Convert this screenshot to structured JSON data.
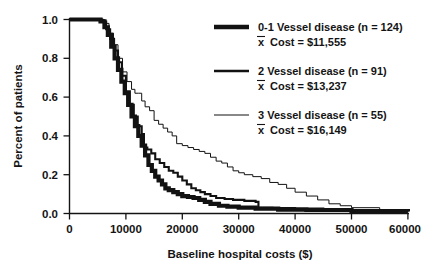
{
  "chart_data": {
    "type": "line",
    "title": "",
    "xlabel": "Baseline hospital costs ($)",
    "ylabel": "Percent of patients",
    "xlim": [
      0,
      60000
    ],
    "ylim": [
      0.0,
      1.0
    ],
    "grid": false,
    "legend_position": "top-right",
    "xticks": [
      "0",
      "10000",
      "20000",
      "30000",
      "40000",
      "50000",
      "60000"
    ],
    "xtick_values": [
      0,
      10000,
      20000,
      30000,
      40000,
      50000,
      60000
    ],
    "yticks": [
      "0.0",
      "0.2",
      "0.4",
      "0.6",
      "0.8",
      "1.0"
    ],
    "ytick_values": [
      0.0,
      0.2,
      0.4,
      0.6,
      0.8,
      1.0
    ],
    "series": [
      {
        "name": "0-1 Vessel disease",
        "n": 124,
        "mean_cost": "$11,555",
        "line_weight": "thick",
        "x": [
          0,
          4000,
          5500,
          6200,
          6800,
          7400,
          8000,
          8600,
          9200,
          9800,
          10400,
          11000,
          11600,
          12200,
          12800,
          13400,
          14000,
          14600,
          15200,
          15800,
          16400,
          17000,
          17600,
          18400,
          19200,
          20000,
          21000,
          22000,
          23000,
          24000,
          25000,
          26500,
          28000,
          30000,
          33000,
          37000,
          42000,
          50000,
          60000
        ],
        "y": [
          1.0,
          1.0,
          0.99,
          0.96,
          0.92,
          0.86,
          0.8,
          0.74,
          0.68,
          0.62,
          0.56,
          0.5,
          0.45,
          0.4,
          0.35,
          0.3,
          0.25,
          0.22,
          0.19,
          0.17,
          0.15,
          0.13,
          0.12,
          0.11,
          0.1,
          0.09,
          0.085,
          0.08,
          0.07,
          0.06,
          0.05,
          0.04,
          0.035,
          0.03,
          0.025,
          0.02,
          0.018,
          0.012,
          0.01
        ]
      },
      {
        "name": "2 Vessel disease",
        "n": 91,
        "mean_cost": "$13,237",
        "line_weight": "medium",
        "x": [
          0,
          4000,
          5800,
          6500,
          7200,
          7900,
          8600,
          9300,
          10000,
          10700,
          11400,
          12100,
          12800,
          13200,
          13800,
          14500,
          15200,
          16000,
          16800,
          17600,
          18400,
          19200,
          20000,
          20800,
          21600,
          22400,
          23200,
          24000,
          25000,
          26000,
          27500,
          29000,
          31000,
          33000,
          33500,
          36000,
          40000,
          45000,
          50000,
          60000
        ],
        "y": [
          1.0,
          1.0,
          0.99,
          0.95,
          0.9,
          0.84,
          0.78,
          0.71,
          0.63,
          0.56,
          0.5,
          0.45,
          0.41,
          0.34,
          0.33,
          0.31,
          0.28,
          0.26,
          0.24,
          0.22,
          0.21,
          0.19,
          0.17,
          0.15,
          0.13,
          0.12,
          0.11,
          0.1,
          0.09,
          0.08,
          0.075,
          0.07,
          0.065,
          0.06,
          0.03,
          0.028,
          0.025,
          0.02,
          0.012,
          0.01
        ]
      },
      {
        "name": "3 Vessel disease",
        "n": 55,
        "mean_cost": "$16,149",
        "line_weight": "thin",
        "x": [
          0,
          4500,
          6200,
          7000,
          7800,
          8600,
          9400,
          10200,
          11000,
          11600,
          12200,
          12800,
          13400,
          14200,
          15000,
          15800,
          16600,
          17400,
          18200,
          19000,
          20000,
          21000,
          22000,
          23000,
          24000,
          25000,
          26000,
          27000,
          28000,
          29000,
          30000,
          31000,
          32500,
          34000,
          35500,
          37000,
          38500,
          40000,
          42000,
          44000,
          46000,
          48000,
          50000,
          55000,
          60000
        ],
        "y": [
          1.0,
          1.0,
          0.98,
          0.93,
          0.87,
          0.8,
          0.73,
          0.68,
          0.64,
          0.62,
          0.62,
          0.58,
          0.55,
          0.53,
          0.48,
          0.46,
          0.44,
          0.42,
          0.4,
          0.36,
          0.35,
          0.34,
          0.33,
          0.32,
          0.31,
          0.29,
          0.27,
          0.26,
          0.24,
          0.22,
          0.21,
          0.2,
          0.19,
          0.18,
          0.16,
          0.15,
          0.13,
          0.11,
          0.09,
          0.07,
          0.05,
          0.04,
          0.03,
          0.02,
          0.01
        ]
      }
    ]
  },
  "legend": {
    "entries": [
      {
        "label": "0-1 Vessel disease (n = 124)",
        "sub": "Cost = $11,555",
        "mean_symbol": "x"
      },
      {
        "label": "2 Vessel disease (n = 91)",
        "sub": "Cost = $13,237",
        "mean_symbol": "x"
      },
      {
        "label": "3 Vessel disease (n = 55)",
        "sub": "Cost = $16,149",
        "mean_symbol": "x"
      }
    ]
  },
  "colors": {
    "ink": "#121212",
    "background": "#ffffff"
  }
}
